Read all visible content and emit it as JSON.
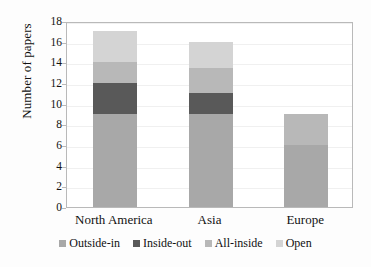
{
  "chart_data": {
    "type": "bar",
    "stacked": true,
    "title": "",
    "xlabel": "",
    "ylabel": "Number of papers",
    "ylim": [
      0,
      18
    ],
    "ytick_step": 2,
    "yticks": [
      0,
      2,
      4,
      6,
      8,
      10,
      12,
      14,
      16,
      18
    ],
    "grid": true,
    "legend_position": "bottom",
    "categories": [
      "North America",
      "Asia",
      "Europe"
    ],
    "series": [
      {
        "name": "Outside-in",
        "color": "#a8a8a8",
        "values": [
          9,
          9,
          6
        ]
      },
      {
        "name": "Inside-out",
        "color": "#595959",
        "values": [
          3,
          2,
          0
        ]
      },
      {
        "name": "All-inside",
        "color": "#b8b8b8",
        "values": [
          2,
          2.5,
          3
        ]
      },
      {
        "name": "Open",
        "color": "#d4d4d4",
        "values": [
          3,
          2.5,
          0
        ]
      }
    ],
    "totals": [
      17,
      15,
      9
    ]
  },
  "axis": {
    "y_title": "Number of papers"
  }
}
